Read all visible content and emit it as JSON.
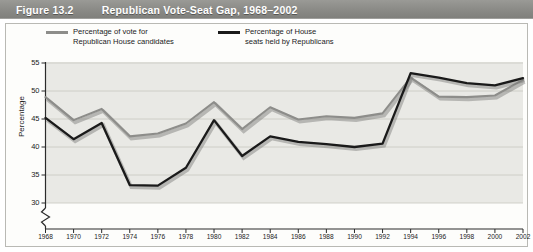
{
  "header": {
    "figure_number": "Figure 13.2",
    "title": "Republican Vote-Seat Gap, 1968–2002",
    "bar_color": "#8c8c88",
    "text_color": "#ffffff"
  },
  "legend": {
    "position": "top-left inside panel",
    "items": [
      {
        "label": "Percentage of vote for\nRepublican House candidates",
        "color": "#8d8d8a",
        "key": "vote"
      },
      {
        "label": "Percentage of House\nseats held by Republicans",
        "color": "#1a1a1a",
        "key": "seats"
      }
    ]
  },
  "chart_data": {
    "type": "line",
    "title": "Republican Vote-Seat Gap, 1968–2002",
    "xlabel": "",
    "ylabel": "Percentage",
    "ylim": [
      28,
      55
    ],
    "yticks": [
      30,
      35,
      40,
      45,
      50,
      55
    ],
    "y_axis_break": true,
    "grid": true,
    "legend_position": "top-left",
    "categories": [
      "1968",
      "1970",
      "1972",
      "1974",
      "1976",
      "1978",
      "1980",
      "1982",
      "1984",
      "1986",
      "1988",
      "1990",
      "1992",
      "1994",
      "1996",
      "1998",
      "2000",
      "2002"
    ],
    "x": [
      1968,
      1970,
      1972,
      1974,
      1976,
      1978,
      1980,
      1982,
      1984,
      1986,
      1988,
      1990,
      1992,
      1994,
      1996,
      1998,
      2000,
      2002
    ],
    "series": [
      {
        "name": "Percentage of vote for Republican House candidates",
        "color": "#8d8d8a",
        "values": [
          48.9,
          44.8,
          46.8,
          41.9,
          42.4,
          44.2,
          48.0,
          43.2,
          47.1,
          44.9,
          45.5,
          45.2,
          46.0,
          52.4,
          49.0,
          48.9,
          49.2,
          52.0
        ]
      },
      {
        "name": "Percentage of House seats held by Republicans",
        "color": "#1a1a1a",
        "values": [
          45.2,
          41.4,
          44.3,
          33.2,
          33.1,
          36.3,
          44.8,
          38.4,
          41.9,
          40.9,
          40.5,
          40.0,
          40.6,
          53.2,
          52.4,
          51.4,
          51.0,
          52.3
        ]
      }
    ]
  }
}
